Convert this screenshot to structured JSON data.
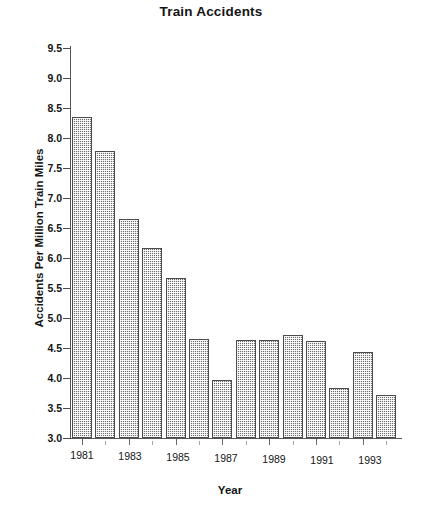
{
  "chart_data": {
    "type": "bar",
    "title": "Train Accidents",
    "xlabel": "Year",
    "ylabel": "Accidents Per Million Train Miles",
    "categories": [
      1981,
      1982,
      1983,
      1984,
      1985,
      1986,
      1987,
      1988,
      1989,
      1990,
      1991,
      1992,
      1993,
      1994
    ],
    "values": [
      8.35,
      7.78,
      6.65,
      6.17,
      5.67,
      4.65,
      3.96,
      4.64,
      4.63,
      4.72,
      4.61,
      3.83,
      4.43,
      3.71
    ],
    "ylim": [
      3.0,
      9.5
    ],
    "ytick_labels": [
      "9.5",
      "9.0",
      "8.5",
      "8.0",
      "7.5",
      "7.0",
      "6.5",
      "6.0",
      "5.5",
      "5.0",
      "4.5",
      "4.0",
      "3.5",
      "3.0"
    ],
    "ytick_values": [
      9.5,
      9.0,
      8.5,
      8.0,
      7.5,
      7.0,
      6.5,
      6.0,
      5.5,
      5.0,
      4.5,
      4.0,
      3.5,
      3.0
    ],
    "xtick_labels": [
      "1981",
      "1983",
      "1985",
      "1987",
      "1989",
      "1991",
      "1993"
    ],
    "xtick_label_indices": [
      0,
      2,
      4,
      6,
      8,
      10,
      12
    ],
    "grid": false,
    "legend": null,
    "bar_color": "#6d6d6d",
    "bar_pattern": "checkered-dither"
  }
}
